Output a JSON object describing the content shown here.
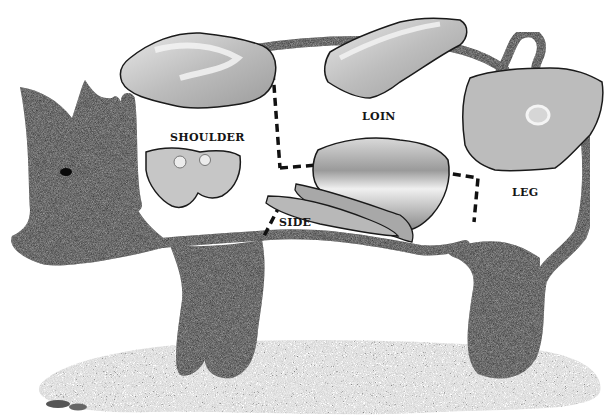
{
  "diagram": {
    "colors": {
      "hide": "#2a2a2a",
      "ground": "#8a8a8a",
      "meat_light": "#cfcfcf",
      "meat_mid": "#a9a9a9",
      "fat": "#eeeeee",
      "divider": "#111111",
      "label": "#151515"
    },
    "cuts": [
      {
        "id": "shoulder",
        "label": "SHOULDER"
      },
      {
        "id": "loin",
        "label": "LOIN"
      },
      {
        "id": "side",
        "label": "SIDE"
      },
      {
        "id": "leg",
        "label": "LEG"
      }
    ]
  }
}
